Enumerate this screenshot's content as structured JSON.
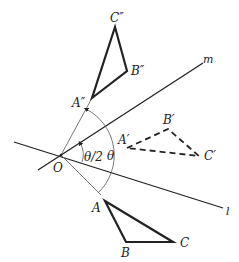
{
  "diagram": {
    "colors": {
      "stroke": "#222222",
      "thin": "#555555",
      "background": "#ffffff"
    },
    "lines": [
      {
        "name": "m",
        "label": "m",
        "from": [
          38,
          170
        ],
        "to": [
          203,
          63
        ]
      },
      {
        "name": "l",
        "label": "l",
        "from": [
          14,
          142
        ],
        "to": [
          223,
          208
        ]
      }
    ],
    "center": {
      "label": "O",
      "point": [
        61,
        155
      ]
    },
    "triangles": [
      {
        "name": "original",
        "style": "solid",
        "vertices": {
          "A": [
            105,
            201
          ],
          "B": [
            126,
            242
          ],
          "C": [
            173,
            242
          ]
        },
        "labels": [
          "A",
          "B",
          "C"
        ]
      },
      {
        "name": "reflected",
        "style": "dashed",
        "vertices": {
          "A'": [
            127,
            148
          ],
          "B'": [
            168,
            129
          ],
          "C'": [
            199,
            156
          ]
        },
        "labels": [
          "A′",
          "B′",
          "C′"
        ]
      },
      {
        "name": "rotated",
        "style": "solid",
        "vertices": {
          "A''": [
            92,
            98
          ],
          "B''": [
            127,
            71
          ],
          "C''": [
            115,
            27
          ]
        },
        "labels": [
          "A″",
          "B″",
          "C″"
        ]
      }
    ],
    "angles": [
      {
        "label": "θ/2",
        "between": [
          "l",
          "m"
        ]
      },
      {
        "label": "θ",
        "between": [
          "OA",
          "OA''"
        ]
      }
    ],
    "labels": {
      "O": "O",
      "m": "m",
      "l": "l",
      "A": "A",
      "B": "B",
      "C": "C",
      "A1": "A′",
      "B1": "B′",
      "C1": "C′",
      "A2": "A″",
      "B2": "B″",
      "C2": "C″",
      "half_theta": "θ/2",
      "theta": "θ"
    }
  }
}
